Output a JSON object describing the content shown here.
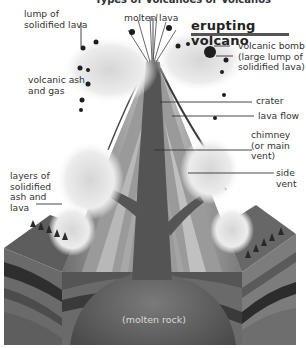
{
  "diagram": {
    "top_heading": "Types of Volcanoes or Volcanos",
    "title": "erupting volcano",
    "labels": {
      "lump": "lump of\nsolidified lava",
      "molten_lava": "molten lava",
      "volcanic_bomb": "volcanic bomb\n(large lump of\nsolidified lava)",
      "ash_gas": "volcanic ash\nand gas",
      "crater": "crater",
      "lava_flow": "lava flow",
      "chimney": "chimney\n(or main\nvent)",
      "side_vent": "side\nvent",
      "layers": "layers of\nsolidified\nash and\nlava",
      "molten_rock": "(molten rock)"
    },
    "colors": {
      "ink": "#333333",
      "magma": "#5a5a5a",
      "ground_light": "#8a8a8a",
      "ground_dark": "#3c3c3c",
      "cloud": "#e4e4e4"
    }
  }
}
